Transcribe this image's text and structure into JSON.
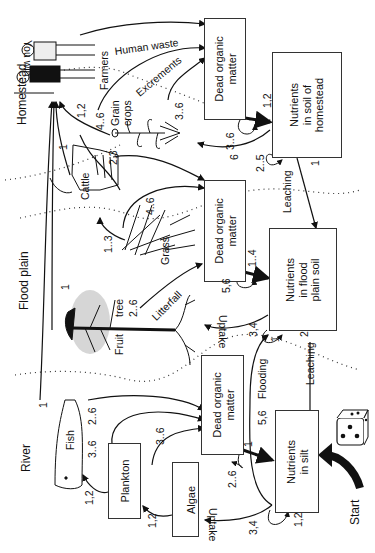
{
  "zones": {
    "river": "River",
    "flood_plain": "Flood plain",
    "homestead": "Homestead"
  },
  "boxes": {
    "dom_homestead": [
      "Dead organic",
      "matter"
    ],
    "nutrients_homestead": [
      "Nutrients",
      "in soil of",
      "homestead"
    ],
    "dom_floodplain": [
      "Dead organic",
      "matter"
    ],
    "nutrients_floodplain": [
      "Nutrients",
      "in flood",
      "plain soil"
    ],
    "dom_river": [
      "Dead organic",
      "matter"
    ],
    "nutrients_silt": [
      "Nutrients",
      "in silt"
    ],
    "plankton": "Plankton",
    "algae": "Algae"
  },
  "organisms": {
    "you_win": "You win",
    "farmers": "Farmers",
    "grain_crops": [
      "Grain",
      "crops"
    ],
    "cattle": "Cattle",
    "grass": "Grass",
    "fruit_tree": [
      "Fruit",
      "tree"
    ],
    "fish": "Fish"
  },
  "flows": {
    "human_waste": "Human waste",
    "excrements": "Excrements",
    "leaching_homestead": "Leaching",
    "leaching_floodplain": "Leaching",
    "litterfall": "Litterfall",
    "uptake_floodplain": "Uptake",
    "uptake_river": "Uptake",
    "flooding": "Flooding"
  },
  "dice_values": {
    "farmers_from_grain": "1,2",
    "grain_to_farmers": "4..6",
    "cattle_to_farmers": "1",
    "fruit_to_farmers": "1",
    "fish_to_farmers": "1",
    "excrements_36": "3..6",
    "nutrients_homestead_12": "1,2",
    "dom_homestead_self": "3..6",
    "grain_uptake_6": "6",
    "homestead_self_25": "2..5",
    "leaching_homestead_1": "1",
    "cattle_to_dom_23": "2,3",
    "grass_to_cattle_13": "1..3",
    "grass_to_dom_46": "4..6",
    "dom_fp_to_nutrients_14": "1..4",
    "dom_fp_self_56": "5,6",
    "litterfall_26": "2..6",
    "uptake_fp_34": "3,4",
    "nutrients_fp_self_1": "1",
    "leaching_fp_2": "2",
    "flooding_56": "5,6",
    "fish_to_dom_26": "2..6",
    "plankton_to_dom_36": "3..6",
    "algae_to_dom_36": "3..6",
    "plankton_to_fish_12": "1,2",
    "algae_to_plankton_12": "1,2",
    "dom_river_to_silt_1": "1",
    "dom_river_self_26": "2..6",
    "silt_uptake_34": "3,4",
    "silt_self_12": "1,2"
  },
  "start": {
    "label": "Start"
  }
}
